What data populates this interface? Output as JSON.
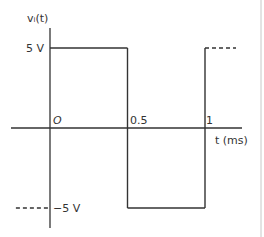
{
  "chart_data": {
    "type": "line",
    "title": "",
    "ylabel": "vᵢ(t)",
    "xlabel": "t (ms)",
    "x_ticks": [
      "0",
      "0.5",
      "1"
    ],
    "y_ticks": [
      "5 V",
      "−5 V"
    ],
    "xlim": [
      -0.32,
      1.15
    ],
    "ylim": [
      -6.1,
      7.0
    ],
    "grid": false,
    "series": [
      {
        "name": "square-wave",
        "points": [
          [
            0,
            5
          ],
          [
            0.5,
            5
          ],
          [
            0.5,
            -5
          ],
          [
            1,
            -5
          ],
          [
            1,
            5
          ]
        ],
        "dashed_extensions": [
          {
            "from": [
              1,
              5
            ],
            "to": [
              1.2,
              5
            ]
          },
          {
            "from": [
              -0.22,
              -5
            ],
            "to": [
              0,
              -5
            ]
          }
        ]
      }
    ],
    "waveform": "square",
    "amplitude_v": 5,
    "period_ms": 1
  },
  "labels": {
    "y_axis": "vᵢ(t)",
    "x_axis": "t (ms)",
    "pos": "5 V",
    "neg": "−5 V",
    "t0": "O",
    "t_half": "0.5",
    "t_one": "1"
  }
}
